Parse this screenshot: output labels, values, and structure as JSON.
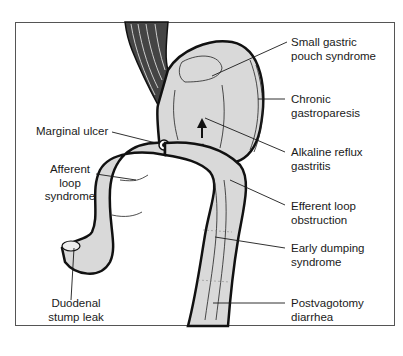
{
  "diagram": {
    "labels": {
      "small_gastric_pouch": [
        "Small gastric",
        "pouch syndrome"
      ],
      "chronic_gastroparesis": [
        "Chronic",
        "gastroparesis"
      ],
      "alkaline_reflux": [
        "Alkaline reflux",
        "gastritis"
      ],
      "efferent_loop": [
        "Efferent loop",
        "obstruction"
      ],
      "early_dumping": [
        "Early dumping",
        "syndrome"
      ],
      "postvagotomy": [
        "Postvagotomy",
        "diarrhea"
      ],
      "marginal_ulcer": [
        "Marginal ulcer"
      ],
      "afferent_loop": [
        "Afferent",
        "loop",
        "syndrome"
      ],
      "duodenal_stump": [
        "Duodenal",
        "stump leak"
      ]
    },
    "colors": {
      "organ_fill": "#d9d9d9",
      "outline": "#111111",
      "frame": "#555555",
      "text": "#1a1a1a"
    }
  }
}
